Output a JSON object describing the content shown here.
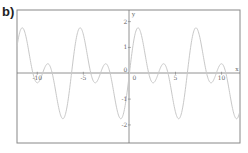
{
  "panel_label": "b)",
  "chart_data": {
    "type": "line",
    "title": "",
    "function": "sin(x) + sin(2x)",
    "xlabel": "x",
    "ylabel": "y",
    "xlim": [
      -12.2,
      12.0
    ],
    "ylim": [
      -2.7,
      2.45
    ],
    "x_ticks": [
      -10,
      -5,
      0,
      5,
      10
    ],
    "x_tick_labels": [
      "-10",
      "-5",
      "0",
      "5",
      "10"
    ],
    "y_ticks": [
      -2,
      -1,
      1,
      2
    ],
    "y_tick_labels": [
      "-2",
      "-1",
      "1",
      "2"
    ],
    "origin_label": "0",
    "grid": false,
    "legend": null,
    "series": [
      {
        "name": "f(x)",
        "color": "#c8c8c8",
        "features": {
          "max": 1.76,
          "min": -1.76,
          "local_max": 0.37,
          "period": 6.283
        }
      }
    ],
    "colors": {
      "frame": "#888888",
      "axes": "#777777",
      "curve": "#c8c8c8",
      "text": "#666666"
    }
  }
}
